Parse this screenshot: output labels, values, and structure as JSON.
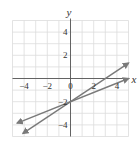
{
  "chart_data": {
    "type": "line",
    "title": "",
    "xlabel": "x",
    "ylabel": "y",
    "xlim": [
      -5,
      5
    ],
    "ylim": [
      -5,
      5
    ],
    "grid": true,
    "x_ticks": [
      "-4",
      "-2",
      "0",
      "2",
      "4"
    ],
    "y_ticks": [
      "4",
      "2",
      "-2",
      "-4"
    ],
    "series": [
      {
        "name": "line-1",
        "equation": "y = (2/3)x - 2",
        "points": [
          [
            -4.1,
            -4.73
          ],
          [
            5,
            1.33
          ]
        ],
        "arrows": "both",
        "color": "#7a7a7a"
      },
      {
        "name": "line-2",
        "equation": "y = (2/5)x - 2",
        "points": [
          [
            -4.6,
            -3.84
          ],
          [
            5,
            0
          ]
        ],
        "arrows": "both",
        "color": "#7a7a7a"
      }
    ],
    "intersection": [
      0,
      -2
    ]
  },
  "labels": {
    "x_axis": "x",
    "y_axis": "y",
    "x_ticks": [
      {
        "text": "−4",
        "v": -4
      },
      {
        "text": "−2",
        "v": -2
      },
      {
        "text": "0",
        "v": 0
      },
      {
        "text": "2",
        "v": 2
      },
      {
        "text": "4",
        "v": 4
      }
    ],
    "y_ticks": [
      {
        "text": "4",
        "v": 4
      },
      {
        "text": "2",
        "v": 2
      },
      {
        "text": "−2",
        "v": -2
      },
      {
        "text": "−4",
        "v": -4
      }
    ]
  }
}
